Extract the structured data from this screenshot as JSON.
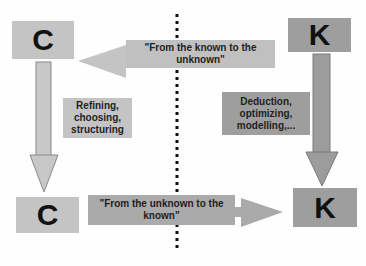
{
  "nodes": {
    "c_top": {
      "label": "C"
    },
    "k_top": {
      "label": "K"
    },
    "c_bottom": {
      "label": "C"
    },
    "k_bottom": {
      "label": "K"
    }
  },
  "edges": {
    "k_to_c": {
      "label": "\"From the known to the unknown\""
    },
    "c_to_c": {
      "label": "Refining, choosing, structuring"
    },
    "k_to_k": {
      "label": "Deduction, optimizing, modelling,..."
    },
    "c_to_k": {
      "label": "\"From the unknown to the known\""
    }
  },
  "colors": {
    "c_fill": "#c4c4c4",
    "k_fill": "#9e9e9e",
    "divider": "#111111",
    "background": "#fefefe"
  }
}
